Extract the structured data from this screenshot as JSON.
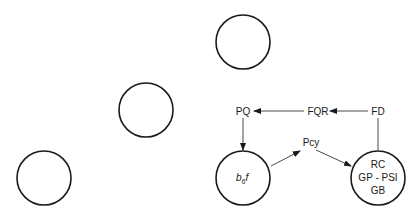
{
  "diagram": {
    "empty_nodes": [
      {
        "id": "circle-top",
        "cx": 243,
        "cy": 42,
        "r": 27
      },
      {
        "id": "circle-middle",
        "cx": 146,
        "cy": 110,
        "r": 27
      },
      {
        "id": "circle-bottom-left",
        "cx": 44,
        "cy": 178,
        "r": 27
      }
    ],
    "b6f_node": {
      "cx": 243,
      "cy": 178,
      "r": 27,
      "label_main": "b",
      "label_sub": "6",
      "label_tail": "f"
    },
    "psi_node": {
      "cx": 378,
      "cy": 178,
      "r": 27,
      "lines": [
        "RC",
        "GP - PSI",
        "GB"
      ]
    },
    "labels": {
      "pq": "PQ",
      "fqr": "FQR",
      "fd": "FD",
      "pcy": "Pcy"
    },
    "edges": [
      {
        "from": "FD",
        "to": "FQR"
      },
      {
        "from": "FQR",
        "to": "PQ"
      },
      {
        "from": "PQ",
        "to": "b6f"
      },
      {
        "from": "b6f",
        "to": "Pcy"
      },
      {
        "from": "Pcy",
        "to": "PSI"
      },
      {
        "from": "PSI",
        "to": "FD"
      }
    ]
  }
}
